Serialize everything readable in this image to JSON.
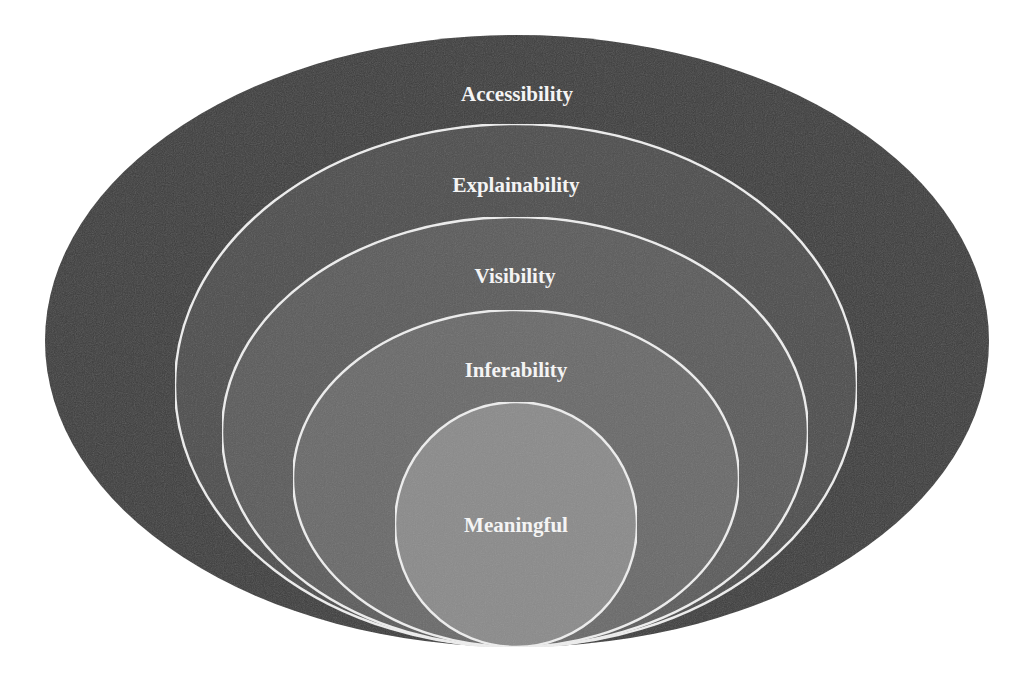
{
  "diagram": {
    "type": "nested-ellipses",
    "bottom_tangent": {
      "x": 516,
      "y": 647
    },
    "layers": [
      {
        "label": "Accessibility",
        "cx": 517,
        "cy": 341,
        "rx": 472,
        "ry": 306,
        "fill": "#3c3c3c",
        "stroke": "none",
        "label_y": 101
      },
      {
        "label": "Explainability",
        "cx": 516,
        "cy": 385.5,
        "rx": 341,
        "ry": 261.5,
        "fill": "#4d4d4d",
        "stroke": "#eeeeee",
        "label_y": 192
      },
      {
        "label": "Visibility",
        "cx": 515,
        "cy": 432,
        "rx": 293,
        "ry": 215,
        "fill": "#5b5b5b",
        "stroke": "#eeeeee",
        "label_y": 283
      },
      {
        "label": "Inferability",
        "cx": 516,
        "cy": 478.5,
        "rx": 223,
        "ry": 168.5,
        "fill": "#6a6a6a",
        "stroke": "#eeeeee",
        "label_y": 377
      },
      {
        "label": "Meaningful",
        "cx": 516,
        "cy": 524.5,
        "rx": 121,
        "ry": 122.5,
        "fill": "#8b8b8b",
        "stroke": "#eeeeee",
        "label_y": 532
      }
    ]
  }
}
